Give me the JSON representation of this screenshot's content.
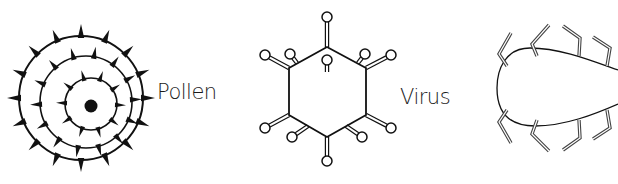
{
  "figures": [
    {
      "id": "pollen",
      "label": "Pollen",
      "description": "Concentric circles with spikes and solid center dot"
    },
    {
      "id": "virus",
      "label": "Virus",
      "description": "Hexagonal capsid with double-bonded lollipop projections"
    },
    {
      "id": "third-particle",
      "label": "",
      "description": "Elongated loop with zig-zag double-line projections (cropped at right edge)"
    }
  ],
  "colors": {
    "background": "#ffffff",
    "ink": "#111111",
    "text": "#1a1a1a"
  }
}
